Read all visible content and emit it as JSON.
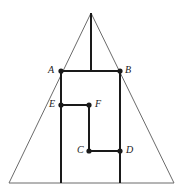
{
  "figure": {
    "canvas": {
      "width": 189,
      "height": 195,
      "background": "#ffffff"
    },
    "colors": {
      "triangle_stroke": "#6b6b6b",
      "polyline_stroke": "#1a1a1a",
      "vertex_dot": "#1a1a1a",
      "label_text": "#1a1a1a"
    },
    "strokes": {
      "triangle_width": 1,
      "polyline_width": 2,
      "dot_radius": 2.6
    },
    "triangle": {
      "name": "outer-triangle",
      "apex": {
        "x": 91,
        "y": 13
      },
      "base_left": {
        "x": 9,
        "y": 183
      },
      "base_right": {
        "x": 174,
        "y": 183
      }
    },
    "altitude": {
      "name": "apex-altitude",
      "from": {
        "x": 91,
        "y": 13
      },
      "to": {
        "x": 91,
        "y": 71
      }
    },
    "points": [
      {
        "id": "A",
        "label": "A",
        "x": 61,
        "y": 71,
        "label_x": 48,
        "label_y": 65,
        "dot": true
      },
      {
        "id": "B",
        "label": "B",
        "x": 120,
        "y": 71,
        "label_x": 125,
        "label_y": 65,
        "dot": true
      },
      {
        "id": "E",
        "label": "E",
        "x": 61,
        "y": 105,
        "label_x": 49,
        "label_y": 99,
        "dot": true
      },
      {
        "id": "F",
        "label": "F",
        "x": 89,
        "y": 105,
        "label_x": 95,
        "label_y": 99,
        "dot": true
      },
      {
        "id": "C",
        "label": "C",
        "x": 89,
        "y": 151,
        "label_x": 77,
        "label_y": 145,
        "dot": true
      },
      {
        "id": "D",
        "label": "D",
        "x": 120,
        "y": 151,
        "label_x": 126,
        "label_y": 145,
        "dot": true
      }
    ],
    "segments": [
      {
        "name": "segment-AB",
        "x1": 61,
        "y1": 71,
        "x2": 120,
        "y2": 71
      },
      {
        "name": "segment-A-base",
        "x1": 61,
        "y1": 71,
        "x2": 61,
        "y2": 183
      },
      {
        "name": "segment-B-base",
        "x1": 120,
        "y1": 71,
        "x2": 120,
        "y2": 183
      },
      {
        "name": "segment-EF",
        "x1": 61,
        "y1": 105,
        "x2": 89,
        "y2": 105
      },
      {
        "name": "segment-FC",
        "x1": 89,
        "y1": 105,
        "x2": 89,
        "y2": 151
      },
      {
        "name": "segment-CD",
        "x1": 89,
        "y1": 151,
        "x2": 120,
        "y2": 151
      }
    ]
  }
}
